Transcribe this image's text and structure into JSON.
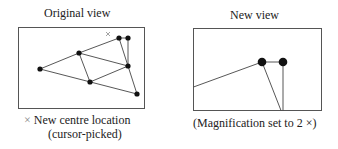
{
  "left_panel": {
    "title": "Original view",
    "marker_symbol": "×",
    "caption_line1": "New centre location",
    "caption_line2": "(cursor-picked)",
    "box": {
      "x": 18,
      "y": 27,
      "w": 126,
      "h": 81
    },
    "nodes": [
      {
        "x": 40,
        "y": 69
      },
      {
        "x": 79,
        "y": 53
      },
      {
        "x": 90,
        "y": 82
      },
      {
        "x": 119,
        "y": 38
      },
      {
        "x": 128,
        "y": 38
      },
      {
        "x": 128,
        "y": 66
      },
      {
        "x": 137,
        "y": 94
      }
    ],
    "edges": [
      [
        0,
        1
      ],
      [
        0,
        2
      ],
      [
        1,
        2
      ],
      [
        1,
        3
      ],
      [
        1,
        5
      ],
      [
        2,
        5
      ],
      [
        2,
        6
      ],
      [
        3,
        4
      ],
      [
        3,
        5
      ],
      [
        4,
        5
      ],
      [
        3,
        6
      ],
      [
        4,
        5
      ]
    ],
    "centre_marker": {
      "x": 108,
      "y": 34
    }
  },
  "right_panel": {
    "title": "New view",
    "caption": "(Magnification set to 2 ×)",
    "box": {
      "x": 193,
      "y": 28,
      "w": 128,
      "h": 83
    },
    "nodes": [
      {
        "x": 262,
        "y": 62
      },
      {
        "x": 283,
        "y": 62
      }
    ]
  },
  "colors": {
    "line": "#444444",
    "node": "#111111",
    "marker": "#999999",
    "text": "#222222"
  }
}
